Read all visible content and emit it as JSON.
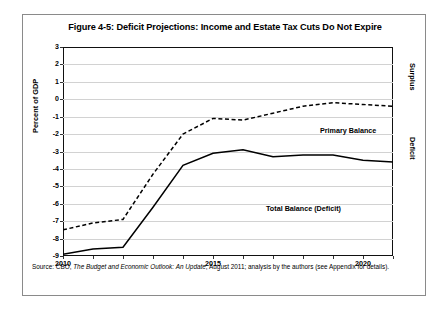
{
  "figure": {
    "title": "Figure 4-5: Deficit Projections: Income and Estate Tax Cuts Do Not Expire",
    "source_prefix": "Source: CBO, ",
    "source_italic": "The Budget and Economic Outlook: An Update",
    "source_suffix": ", August 2011; analysis by the authors (see Appendix for details)."
  },
  "axis": {
    "y_label": "Percent of GDP",
    "right_label_top": "Surplus",
    "right_label_bottom": "Deficit"
  },
  "series_labels": {
    "primary": "Primary Balance",
    "total": "Total Balance (Deficit)"
  },
  "chart_data": {
    "type": "line",
    "title": "Figure 4-5: Deficit Projections: Income and Estate Tax Cuts Do Not Expire",
    "xlabel": "",
    "ylabel": "Percent of GDP",
    "xlim": [
      2010,
      2021
    ],
    "ylim": [
      -9,
      3
    ],
    "grid": true,
    "legend": "inline-annotations",
    "yticks": [
      3,
      2,
      1,
      0,
      -1,
      -2,
      -3,
      -4,
      -5,
      -6,
      -7,
      -8,
      -9
    ],
    "ytick_labels": [
      "3",
      "2",
      "1",
      "0",
      "-1",
      "-2",
      "-3",
      "-4",
      "-5",
      "-6",
      "-7",
      "-8",
      "-9"
    ],
    "xticks": [
      2010,
      2011,
      2012,
      2013,
      2014,
      2015,
      2016,
      2017,
      2018,
      2019,
      2020,
      2021
    ],
    "xtick_labels": [
      "2010",
      "",
      "",
      "",
      "",
      "2015",
      "",
      "",
      "",
      "",
      "2020",
      ""
    ],
    "x": [
      2010,
      2011,
      2012,
      2013,
      2014,
      2015,
      2016,
      2017,
      2018,
      2019,
      2020,
      2021
    ],
    "series": [
      {
        "name": "Primary Balance",
        "style": "dashed",
        "color": "#000000",
        "values": [
          -7.5,
          -7.1,
          -6.9,
          -4.3,
          -2.0,
          -1.1,
          -1.2,
          -0.8,
          -0.4,
          -0.2,
          -0.3,
          -0.4
        ]
      },
      {
        "name": "Total Balance (Deficit)",
        "style": "solid",
        "color": "#000000",
        "values": [
          -8.9,
          -8.6,
          -8.5,
          -6.2,
          -3.8,
          -3.1,
          -2.9,
          -3.3,
          -3.2,
          -3.2,
          -3.5,
          -3.6
        ]
      }
    ],
    "annotations": [
      {
        "text": "Primary Balance",
        "x": 2017.6,
        "y": 0.55
      },
      {
        "text": "Total Balance (Deficit)",
        "x": 2015.1,
        "y": -3.9
      },
      {
        "text": "Surplus",
        "axis": "right",
        "position": "upper"
      },
      {
        "text": "Deficit",
        "axis": "right",
        "position": "lower"
      }
    ]
  }
}
